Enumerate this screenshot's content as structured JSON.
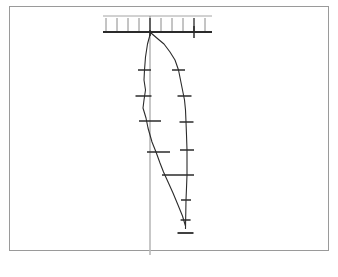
{
  "figure": {
    "domain": "diagram",
    "title": "",
    "background_color": "#ffffff",
    "border_color": "#9a9a9a",
    "ink_color": "#2b2b2b",
    "reference_line_color": "#b9b9b9",
    "frame": {
      "x": 9,
      "y": 6,
      "width": 320,
      "height": 245
    }
  },
  "chart_data": {
    "type": "line",
    "title": "",
    "subtitle": "",
    "xlabel": "",
    "ylabel": "",
    "xlim": [
      100,
      215
    ],
    "ylim": [
      26,
      240
    ],
    "grid": false,
    "legend_position": "none",
    "orientation": "vertical-depth-profile",
    "datum": {
      "name": "ground-datum-bar",
      "y": 32,
      "x_start": 103,
      "x_end": 212,
      "thickness": 2.2
    },
    "upper_rule": {
      "name": "upper-thin-rule",
      "y": 16,
      "x_start": 103,
      "x_end": 212,
      "thickness": 0.8
    },
    "scale_ticks": {
      "name": "top-scale-ticks",
      "y_top": 18,
      "y_bottom": 31,
      "x_positions": [
        106,
        117,
        128,
        139,
        150,
        161,
        172,
        183,
        194,
        205
      ],
      "major_x_positions": [
        150,
        194
      ],
      "count": 10
    },
    "reference_line": {
      "name": "vertical-reference-line",
      "x": 150,
      "y_start": 16,
      "y_end": 255
    },
    "series": [
      {
        "name": "left-profile",
        "label": "",
        "color": "#2b2b2b",
        "points": [
          {
            "x": 150.5,
            "y": 33
          },
          {
            "x": 147.5,
            "y": 44
          },
          {
            "x": 145.5,
            "y": 57
          },
          {
            "x": 144.5,
            "y": 70
          },
          {
            "x": 144.0,
            "y": 80
          },
          {
            "x": 145.5,
            "y": 90
          },
          {
            "x": 144.0,
            "y": 100
          },
          {
            "x": 143.0,
            "y": 108
          },
          {
            "x": 146.0,
            "y": 118
          },
          {
            "x": 148.0,
            "y": 128
          },
          {
            "x": 150.0,
            "y": 135
          },
          {
            "x": 152.0,
            "y": 142
          },
          {
            "x": 156.0,
            "y": 152
          },
          {
            "x": 160.0,
            "y": 163
          },
          {
            "x": 163.5,
            "y": 172
          },
          {
            "x": 168.5,
            "y": 183
          },
          {
            "x": 173.0,
            "y": 193
          },
          {
            "x": 178.0,
            "y": 205
          },
          {
            "x": 182.5,
            "y": 216
          },
          {
            "x": 185.5,
            "y": 226
          }
        ],
        "error_bars": [
          {
            "x": 144.5,
            "y": 70,
            "half_width": 6.5
          },
          {
            "x": 143.5,
            "y": 96,
            "half_width": 8.0
          },
          {
            "x": 150.0,
            "y": 121,
            "half_width": 11.0
          },
          {
            "x": 158.5,
            "y": 152,
            "half_width": 11.5
          },
          {
            "x": 171.0,
            "y": 175,
            "half_width": 9.0
          }
        ]
      },
      {
        "name": "right-profile",
        "label": "",
        "color": "#2b2b2b",
        "points": [
          {
            "x": 151.0,
            "y": 33
          },
          {
            "x": 158.0,
            "y": 39
          },
          {
            "x": 164.0,
            "y": 44
          },
          {
            "x": 170.0,
            "y": 52
          },
          {
            "x": 175.0,
            "y": 60
          },
          {
            "x": 178.5,
            "y": 70
          },
          {
            "x": 180.5,
            "y": 80
          },
          {
            "x": 182.5,
            "y": 90
          },
          {
            "x": 184.5,
            "y": 100
          },
          {
            "x": 185.5,
            "y": 110
          },
          {
            "x": 186.0,
            "y": 122
          },
          {
            "x": 186.5,
            "y": 135
          },
          {
            "x": 187.0,
            "y": 150
          },
          {
            "x": 187.0,
            "y": 162
          },
          {
            "x": 187.0,
            "y": 175
          },
          {
            "x": 186.5,
            "y": 188
          },
          {
            "x": 186.0,
            "y": 200
          },
          {
            "x": 185.8,
            "y": 212
          },
          {
            "x": 185.6,
            "y": 222
          },
          {
            "x": 185.5,
            "y": 229
          }
        ],
        "error_bars": [
          {
            "x": 178.5,
            "y": 70,
            "half_width": 6.5
          },
          {
            "x": 184.5,
            "y": 96,
            "half_width": 7.0
          },
          {
            "x": 186.5,
            "y": 122,
            "half_width": 7.0
          },
          {
            "x": 187.0,
            "y": 150,
            "half_width": 7.0
          },
          {
            "x": 187.0,
            "y": 175,
            "half_width": 7.0
          },
          {
            "x": 186.0,
            "y": 200,
            "half_width": 5.0
          },
          {
            "x": 185.6,
            "y": 220,
            "half_width": 5.0
          }
        ]
      }
    ],
    "terminus": {
      "name": "bottom-terminus-bar",
      "x": 185.5,
      "y": 233,
      "half_width": 8.0
    },
    "datum_markers": [
      {
        "name": "datum-tick-center",
        "x": 150,
        "y_top": 30,
        "y_bottom": 36
      },
      {
        "name": "datum-tick-right",
        "x": 194,
        "y_top": 26,
        "y_bottom": 38
      }
    ]
  }
}
